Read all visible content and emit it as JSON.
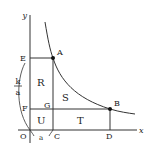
{
  "diagram": {
    "axes": {
      "x_label": "x",
      "y_label": "y",
      "origin_label": "O"
    },
    "points": {
      "A": "A",
      "B": "B",
      "C": "C",
      "D": "D",
      "E": "E",
      "F": "F",
      "G": "G"
    },
    "regions": {
      "R": "R",
      "S": "S",
      "T": "T",
      "U": "U"
    },
    "brace_labels": {
      "left_numerator": "k",
      "left_denominator": "a",
      "bottom": "a"
    },
    "colors": {
      "line": "#333333",
      "point": "#111111"
    }
  }
}
